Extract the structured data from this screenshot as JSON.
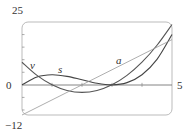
{
  "chart_data": {
    "type": "line",
    "title": "",
    "xlabel": "",
    "ylabel": "",
    "xlim": [
      0,
      5
    ],
    "ylim": [
      -12,
      25
    ],
    "x_tick_labels": [
      "0",
      "5"
    ],
    "y_tick_labels": [
      "25",
      "-12"
    ],
    "x_ticks": [
      1,
      2,
      3,
      4
    ],
    "y_ticks": [
      -10,
      -5,
      5,
      10,
      15,
      20
    ],
    "grid": false,
    "legend": "inline labels",
    "series": [
      {
        "name": "s",
        "formula": "t^3 - 6t^2 + 9t",
        "x": [
          0,
          0.5,
          1,
          1.5,
          2,
          2.5,
          3,
          3.5,
          4,
          4.5,
          5
        ],
        "values": [
          0,
          3.125,
          4,
          3.375,
          2,
          0.625,
          0,
          0.875,
          4,
          10.125,
          20
        ]
      },
      {
        "name": "v",
        "formula": "3t^2 - 12t + 9",
        "x": [
          0,
          0.5,
          1,
          1.5,
          2,
          2.5,
          3,
          3.5,
          4,
          4.5,
          5
        ],
        "values": [
          9,
          3.75,
          0,
          -2.25,
          -3,
          -2.25,
          0,
          3.75,
          9,
          15.75,
          24
        ]
      },
      {
        "name": "a",
        "formula": "6t - 12",
        "x": [
          0,
          5
        ],
        "values": [
          -12,
          18
        ]
      }
    ]
  },
  "labels": {
    "y_top": "25",
    "y_bottom": "−12",
    "x_left": "0",
    "x_right": "5",
    "curve_v": "v",
    "curve_s": "s",
    "curve_a": "a"
  }
}
